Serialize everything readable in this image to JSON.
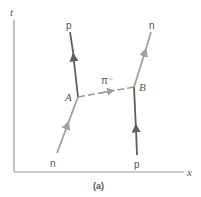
{
  "figure": {
    "caption": "(a)",
    "axes": {
      "vertical_label": "t",
      "horizontal_label": "x"
    },
    "vertices": {
      "a": "A",
      "b": "B"
    },
    "particles": {
      "incoming_left": "n",
      "outgoing_left": "p",
      "incoming_right": "p",
      "outgoing_right": "n",
      "exchanged": "π⁻"
    },
    "colors": {
      "axis": "#9a9a9a",
      "neutron_line": "#a0a0a0",
      "proton_line": "#606060",
      "pion_line": "#9a9a9a",
      "text": "#555555"
    }
  }
}
